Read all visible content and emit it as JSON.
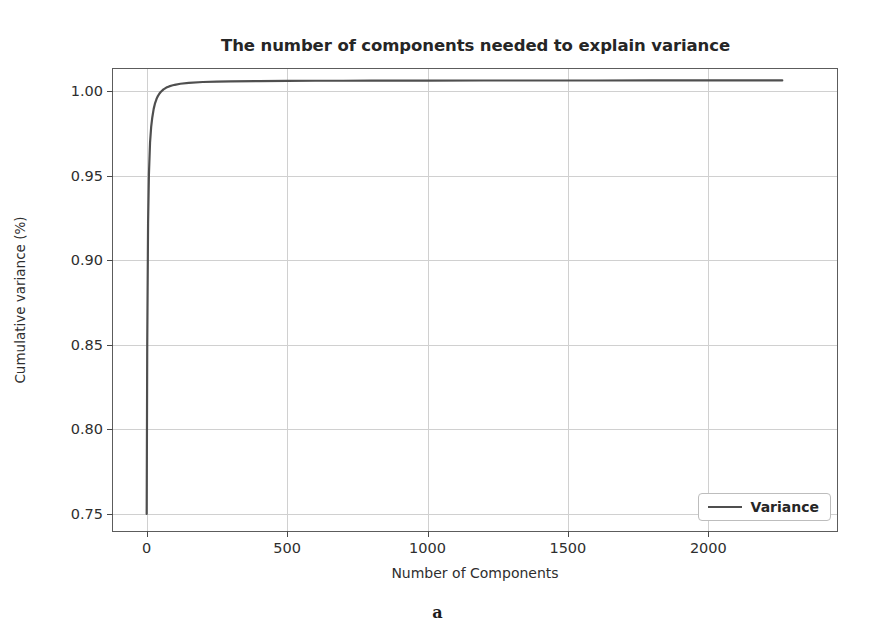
{
  "figure": {
    "caption": "a",
    "scan_artifact": "    "
  },
  "legend": {
    "position": "lower-right",
    "entries": [
      {
        "label": "Variance",
        "color": "#4f4f4f",
        "marker": "line"
      }
    ]
  },
  "chart_data": {
    "type": "line",
    "title": "The number of components needed to explain variance",
    "xlabel": "Number of Components",
    "ylabel": "Cumulative variance (%)",
    "xlim": [
      -120,
      2460
    ],
    "ylim": [
      0.7435,
      1.0065
    ],
    "grid": true,
    "legend_position": "lower right",
    "xticks": [
      0,
      500,
      1000,
      1500,
      2000
    ],
    "xtick_labels": [
      "0",
      "500",
      "1000",
      "1500",
      "2000"
    ],
    "yticks": [
      0.75,
      0.8,
      0.85,
      0.9,
      0.95,
      1.0
    ],
    "ytick_labels": [
      "0.75",
      "0.80",
      "0.85",
      "0.90",
      "0.95",
      "1.00"
    ],
    "series": [
      {
        "name": "Variance",
        "color": "#4f4f4f",
        "linewidth": 2.2,
        "x": [
          0,
          2,
          5,
          8,
          12,
          16,
          20,
          25,
          30,
          35,
          40,
          45,
          50,
          60,
          70,
          80,
          90,
          100,
          120,
          150,
          200,
          250,
          300,
          400,
          500,
          600,
          700,
          800,
          900,
          1000,
          1200,
          1400,
          1600,
          1800,
          2000,
          2150,
          2265
        ],
        "y": [
          0.7532,
          0.8495,
          0.9185,
          0.9465,
          0.9645,
          0.9735,
          0.9789,
          0.9838,
          0.9871,
          0.9894,
          0.9911,
          0.9924,
          0.9934,
          0.9949,
          0.9959,
          0.9966,
          0.9971,
          0.9975,
          0.9981,
          0.9986,
          0.9991,
          0.9993,
          0.9995,
          0.9996,
          0.9997,
          0.9998,
          0.9998,
          0.9999,
          0.9999,
          0.9999,
          0.99995,
          0.99996,
          0.99997,
          0.99998,
          0.99999,
          1.0,
          1.0
        ]
      }
    ]
  }
}
